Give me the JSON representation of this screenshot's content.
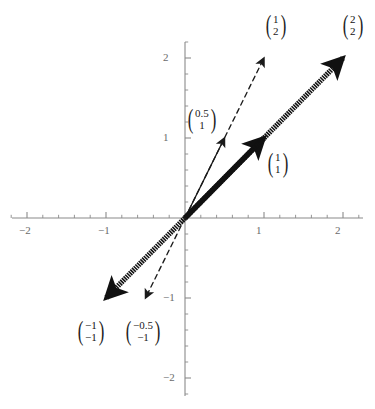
{
  "chart_data": {
    "type": "scatter",
    "title": "",
    "xlabel": "",
    "ylabel": "",
    "xlim": [
      -2.3,
      2.3
    ],
    "ylim": [
      -2.3,
      2.3
    ],
    "grid": false,
    "legend": "none",
    "axes": {
      "x_ticks": [
        -2,
        -1,
        1,
        2
      ],
      "y_ticks": [
        -2,
        -1,
        1,
        2
      ],
      "x_tick_labels": [
        "-2",
        "-1",
        "1",
        "2"
      ],
      "y_tick_labels": [
        "-2",
        "-1",
        "1",
        "2"
      ],
      "minor_tick_step": 0.2,
      "axis_color": "#8a8a8a",
      "tick_label_color": "#6b6b6b"
    },
    "vectors": [
      {
        "name": "vector-0.5-1",
        "x": 0.5,
        "y": 1,
        "style": "solid",
        "weight": "thin",
        "color": "#1a1a1a",
        "label_top": "0.5",
        "label_bottom": "1",
        "label_x": 186,
        "label_y": 106
      },
      {
        "name": "vector-1-1",
        "x": 1,
        "y": 1,
        "style": "solid",
        "weight": "thick",
        "color": "#111111",
        "label_top": "1",
        "label_bottom": "1",
        "label_x": 266,
        "label_y": 150
      },
      {
        "name": "vector-1-2",
        "x": 1,
        "y": 2,
        "style": "dashed",
        "weight": "thin",
        "color": "#1a1a1a",
        "label_top": "1",
        "label_bottom": "2",
        "label_x": 264,
        "label_y": 12
      },
      {
        "name": "vector-2-2",
        "x": 2,
        "y": 2,
        "style": "dashed",
        "weight": "thick",
        "color": "#111111",
        "label_top": "2",
        "label_bottom": "2",
        "label_x": 341,
        "label_y": 12
      },
      {
        "name": "vector-neg1-neg1",
        "x": -1,
        "y": -1,
        "style": "dashed",
        "weight": "thick",
        "color": "#111111",
        "label_top": "−1",
        "label_bottom": "−1",
        "label_x": 76,
        "label_y": 318
      },
      {
        "name": "vector-neg0.5-neg1",
        "x": -0.5,
        "y": -1,
        "style": "dashed",
        "weight": "thin",
        "color": "#1a1a1a",
        "label_top": "−0.5",
        "label_bottom": "−1",
        "label_x": 124,
        "label_y": 318
      }
    ]
  },
  "figure": {
    "origin_px": {
      "x": 185,
      "y": 218
    },
    "unit_px": {
      "x": 79,
      "y": 80
    },
    "background": "#ffffff"
  }
}
